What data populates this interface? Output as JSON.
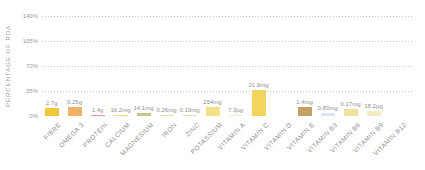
{
  "chart_data": {
    "type": "bar",
    "title": "",
    "xlabel": "",
    "ylabel": "PERCENTAGE OF RDA",
    "ylim": [
      0,
      140
    ],
    "y_ticks": [
      {
        "label": "140%",
        "value": 140
      },
      {
        "label": "105%",
        "value": 105
      },
      {
        "label": "70%",
        "value": 70
      },
      {
        "label": "35%",
        "value": 35
      },
      {
        "label": "0%",
        "value": 0
      }
    ],
    "grid": "horizontal-dotted",
    "legend_position": "none",
    "categories": [
      "FIBRE",
      "OMEGA 3",
      "PROTEIN",
      "CALCIUM",
      "MAGNESIUM",
      "IRON",
      "ZINC",
      "POTASSIUM",
      "VITAMIN A",
      "VITAMIN C",
      "VITAMIN D",
      "VITAMIN E",
      "VITAMIN B3",
      "VITAMIN B6",
      "VITAMIN B9",
      "VITAMIN B12"
    ],
    "series": [
      {
        "name": "% of RDA",
        "value_labels": [
          "2.7g",
          "0.25g",
          "1.4g",
          "16.2mg",
          "14.1mg",
          "0.26mg",
          "0.19mg",
          "254mg",
          "7.3µg",
          "21.9mg",
          "",
          "1.4mg",
          "0.83mg",
          "0.17mg",
          "18.2µg",
          ""
        ],
        "values_pct_of_rda": [
          11,
          13,
          2,
          2,
          4.5,
          1.5,
          1.5,
          13,
          1,
          36,
          0,
          12.5,
          4,
          10,
          7,
          0
        ],
        "bar_colors": [
          "#F2C73F",
          "#F0B169",
          "#E89C8C",
          "#F0DC8C",
          "#CBC489",
          "#EBDFA8",
          "#E8DCB0",
          "#F3E187",
          "#F3ECC8",
          "#F3D45E",
          "",
          "#C2A162",
          "#DCE6EA",
          "#EFE2A0",
          "#F3ECC0",
          ""
        ]
      }
    ]
  },
  "colors": {
    "background": "#FFFFFF",
    "grid": "#C9C9C9",
    "tick_text": "#9A9A9A",
    "value_text": "#8F8F8F",
    "category_text": "#8E8E8E"
  }
}
